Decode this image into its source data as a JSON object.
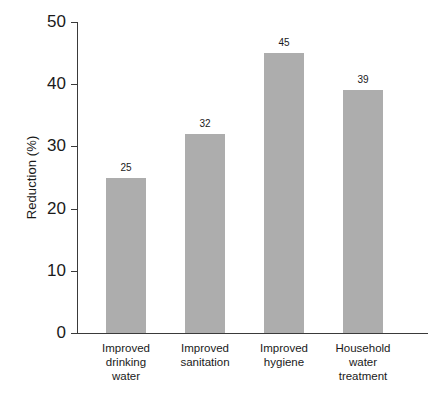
{
  "chart_data": {
    "type": "bar",
    "title": "",
    "subtitle": "",
    "xlabel": "",
    "ylabel": "Reduction (%)",
    "ylim": [
      0,
      50
    ],
    "ytick_values": [
      0,
      10,
      20,
      30,
      40,
      50
    ],
    "ytick_labels": [
      "0",
      "10",
      "20",
      "30",
      "40",
      "50"
    ],
    "grid": false,
    "legend": false,
    "legend_position": "none",
    "bar_color": "#adadad",
    "axis_color": "#3a3a3a",
    "background_color": "#ffffff",
    "categories": [
      "Improved drinking water",
      "Improved sanitation",
      "Improved hygiene",
      "Household water treatment"
    ],
    "category_label_lines": [
      [
        "Improved",
        "drinking",
        "water"
      ],
      [
        "Improved",
        "sanitation"
      ],
      [
        "Improved",
        "hygiene"
      ],
      [
        "Household",
        "water",
        "treatment"
      ]
    ],
    "values": [
      25,
      32,
      45,
      39
    ],
    "value_labels": [
      "25",
      "32",
      "45",
      "39"
    ]
  }
}
